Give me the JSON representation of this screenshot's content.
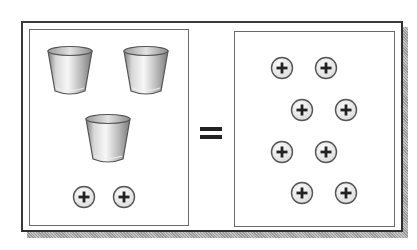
{
  "diagram": {
    "type": "balance-equation",
    "operator": "=",
    "left_side": {
      "cups": [
        {
          "id": "cup-1",
          "x": 45,
          "y": 44
        },
        {
          "id": "cup-2",
          "x": 121,
          "y": 44
        },
        {
          "id": "cup-3",
          "x": 83,
          "y": 112
        }
      ],
      "tiles": [
        {
          "id": "left-tile-1",
          "sign": "+",
          "x": 72,
          "y": 185
        },
        {
          "id": "left-tile-2",
          "sign": "+",
          "x": 112,
          "y": 185
        }
      ]
    },
    "right_side": {
      "tiles": [
        {
          "id": "right-tile-1",
          "sign": "+",
          "x": 270,
          "y": 56
        },
        {
          "id": "right-tile-2",
          "sign": "+",
          "x": 314,
          "y": 56
        },
        {
          "id": "right-tile-3",
          "sign": "+",
          "x": 290,
          "y": 98
        },
        {
          "id": "right-tile-4",
          "sign": "+",
          "x": 334,
          "y": 98
        },
        {
          "id": "right-tile-5",
          "sign": "+",
          "x": 270,
          "y": 140
        },
        {
          "id": "right-tile-6",
          "sign": "+",
          "x": 314,
          "y": 140
        },
        {
          "id": "right-tile-7",
          "sign": "+",
          "x": 290,
          "y": 181
        },
        {
          "id": "right-tile-8",
          "sign": "+",
          "x": 334,
          "y": 181
        }
      ]
    },
    "counts": {
      "cups": 3,
      "left_positive_tiles": 2,
      "right_positive_tiles": 8
    },
    "colors": {
      "frame": "#3a3a3a",
      "panel_border": "#6a6a6a",
      "tile_fill": "#ececec",
      "tile_border": "#555555",
      "plus": "#222222",
      "cup_light": "#f4f4f4",
      "cup_dark": "#8a8a8a"
    }
  }
}
